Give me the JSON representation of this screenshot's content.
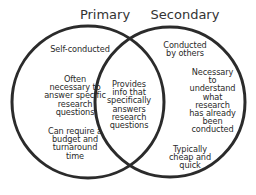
{
  "diagram": {
    "type": "venn",
    "stroke_color": "#2b2b2b",
    "background": "#ffffff",
    "sets": [
      {
        "id": "primary",
        "title": "Primary",
        "items": [
          "Self-conducted",
          "Often necessary to answer specific research questions",
          "Can require a budget and turnaround time"
        ]
      },
      {
        "id": "secondary",
        "title": "Secondary",
        "items": [
          "Conducted by others",
          "Necessary to understand what research has already been conducted",
          "Typically cheap and quick"
        ]
      }
    ],
    "overlap": {
      "items": [
        "Provides info that specifically answers research questions"
      ]
    }
  },
  "primary": {
    "title": "Primary",
    "item1": "Self-conducted",
    "item2_lines": [
      "Often",
      "necessary to",
      "answer specific",
      "research",
      "questions"
    ],
    "item3_lines": [
      "Can require a",
      "budget and",
      "turnaround",
      "time"
    ]
  },
  "secondary": {
    "title": "Secondary",
    "item1_lines": [
      "Conducted",
      "by others"
    ],
    "item2_lines": [
      "Necessary",
      "to",
      "understand",
      "what",
      "research",
      "has already",
      "been",
      "conducted"
    ],
    "item3_lines": [
      "Typically",
      "cheap and",
      "quick"
    ]
  },
  "overlap": {
    "item1_lines": [
      "Provides",
      "info that",
      "specifically",
      "answers",
      "research",
      "questions"
    ]
  }
}
